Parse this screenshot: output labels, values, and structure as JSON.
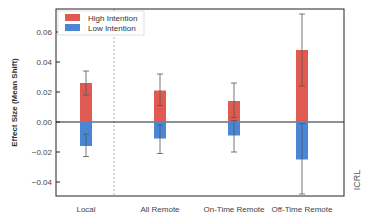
{
  "chart_data": {
    "type": "bar",
    "title": "",
    "xlabel": "",
    "ylabel": "Effect Size (Mean Shift)",
    "ylim": [
      -0.05,
      0.075
    ],
    "yticks": [
      0.06,
      0.04,
      0.02,
      0.0,
      -0.02,
      -0.04
    ],
    "ytick_labels": [
      "0.06",
      "0.04",
      "0.02",
      "0.00",
      "−0.02",
      "−0.04"
    ],
    "categories": [
      "Local",
      "All Remote",
      "On-Time Remote",
      "Off-Time Remote"
    ],
    "series": [
      {
        "name": "High Intention",
        "color": "#e05a52",
        "values": [
          0.026,
          0.021,
          0.014,
          0.048
        ],
        "error_low": [
          0.018,
          0.011,
          0.003,
          0.024
        ],
        "error_high": [
          0.034,
          0.032,
          0.026,
          0.072
        ]
      },
      {
        "name": "Low Intention",
        "color": "#4a86d4",
        "values": [
          -0.016,
          -0.011,
          -0.009,
          -0.025
        ],
        "error_low": [
          -0.023,
          -0.021,
          -0.02,
          -0.048
        ],
        "error_high": [
          -0.008,
          -0.002,
          0.001,
          -0.001
        ]
      }
    ],
    "grid": false,
    "legend_position": "upper left",
    "reference_line": 0.0,
    "separator_after_category": "Local",
    "watermark": "ICRL"
  },
  "legend": {
    "items": [
      {
        "label": "High Intention",
        "color": "#e05a52"
      },
      {
        "label": "Low Intention",
        "color": "#4a86d4"
      }
    ]
  },
  "axis": {
    "ylabel": "Effect Size (Mean Shift)"
  },
  "watermark": "ICRL"
}
